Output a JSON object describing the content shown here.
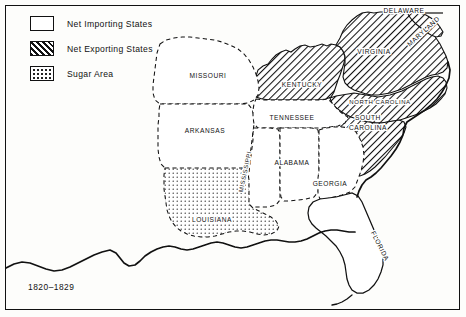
{
  "map": {
    "caption": "1820–1829",
    "legend": {
      "items": [
        {
          "pattern": "empty",
          "label": "Net Importing States",
          "icon": "empty-swatch-icon"
        },
        {
          "pattern": "hatch",
          "label": "Net Exporting States",
          "icon": "hatched-swatch-icon"
        },
        {
          "pattern": "dots",
          "label": "Sugar Area",
          "icon": "dotted-swatch-icon"
        }
      ]
    },
    "colors": {
      "ink": "#111111",
      "paper": "#fdfdfb",
      "label_halo": "#ffffff"
    },
    "states": [
      {
        "name": "MISSOURI",
        "category": "importing",
        "x": 208,
        "y": 78,
        "rotate": 0
      },
      {
        "name": "ARKANSAS",
        "category": "importing",
        "x": 205,
        "y": 133,
        "rotate": 0
      },
      {
        "name": "TENNESSEE",
        "category": "importing",
        "x": 292,
        "y": 120,
        "rotate": 0
      },
      {
        "name": "KENTUCKY",
        "category": "exporting",
        "x": 302,
        "y": 87,
        "rotate": 0
      },
      {
        "name": "VIRGINIA",
        "category": "exporting",
        "x": 374,
        "y": 54,
        "rotate": 0
      },
      {
        "name": "DELAWARE",
        "category": "exporting",
        "x": 404,
        "y": 13,
        "rotate": 0
      },
      {
        "name": "MARYLAND",
        "category": "exporting",
        "x": 425,
        "y": 33,
        "rotate": -42
      },
      {
        "name": "NORTH CAROLINA",
        "category": "exporting",
        "x": 380,
        "y": 104,
        "rotate": 0
      },
      {
        "name": "SOUTH",
        "category": "exporting",
        "x": 368,
        "y": 120,
        "rotate": 0
      },
      {
        "name": "CAROLINA",
        "category": "exporting",
        "x": 368,
        "y": 130,
        "rotate": 0
      },
      {
        "name": "MISSISSIPPI",
        "category": "importing",
        "x": 247,
        "y": 172,
        "rotate": -78
      },
      {
        "name": "ALABAMA",
        "category": "importing",
        "x": 292,
        "y": 165,
        "rotate": 0
      },
      {
        "name": "GEORGIA",
        "category": "importing",
        "x": 330,
        "y": 186,
        "rotate": 0
      },
      {
        "name": "LOUISIANA",
        "category": "sugar",
        "x": 212,
        "y": 222,
        "rotate": 0
      },
      {
        "name": "FLORIDA",
        "category": "importing",
        "x": 378,
        "y": 247,
        "rotate": 63
      }
    ]
  }
}
